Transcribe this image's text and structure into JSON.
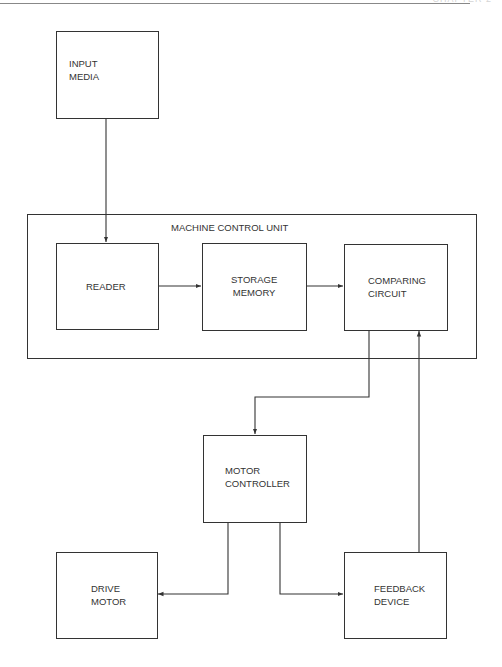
{
  "header": {
    "page_ref": "CHAPTER 2"
  },
  "diagram": {
    "container": {
      "label": "MACHINE CONTROL UNIT"
    },
    "nodes": [
      {
        "id": "input_media",
        "line1": "INPUT",
        "line2": "MEDIA"
      },
      {
        "id": "reader",
        "line1": "READER",
        "line2": ""
      },
      {
        "id": "storage_memory",
        "line1": "STORAGE",
        "line2": "MEMORY"
      },
      {
        "id": "comparing_circuit",
        "line1": "COMPARING",
        "line2": "CIRCUIT"
      },
      {
        "id": "motor_controller",
        "line1": "MOTOR",
        "line2": "CONTROLLER"
      },
      {
        "id": "drive_motor",
        "line1": "DRIVE",
        "line2": "MOTOR"
      },
      {
        "id": "feedback_device",
        "line1": "FEEDBACK",
        "line2": "DEVICE"
      }
    ],
    "edges": [
      {
        "from": "input_media",
        "to": "reader"
      },
      {
        "from": "reader",
        "to": "storage_memory"
      },
      {
        "from": "storage_memory",
        "to": "comparing_circuit"
      },
      {
        "from": "comparing_circuit",
        "to": "motor_controller"
      },
      {
        "from": "motor_controller",
        "to": "drive_motor"
      },
      {
        "from": "motor_controller",
        "to": "feedback_device"
      },
      {
        "from": "feedback_device",
        "to": "comparing_circuit"
      }
    ]
  }
}
